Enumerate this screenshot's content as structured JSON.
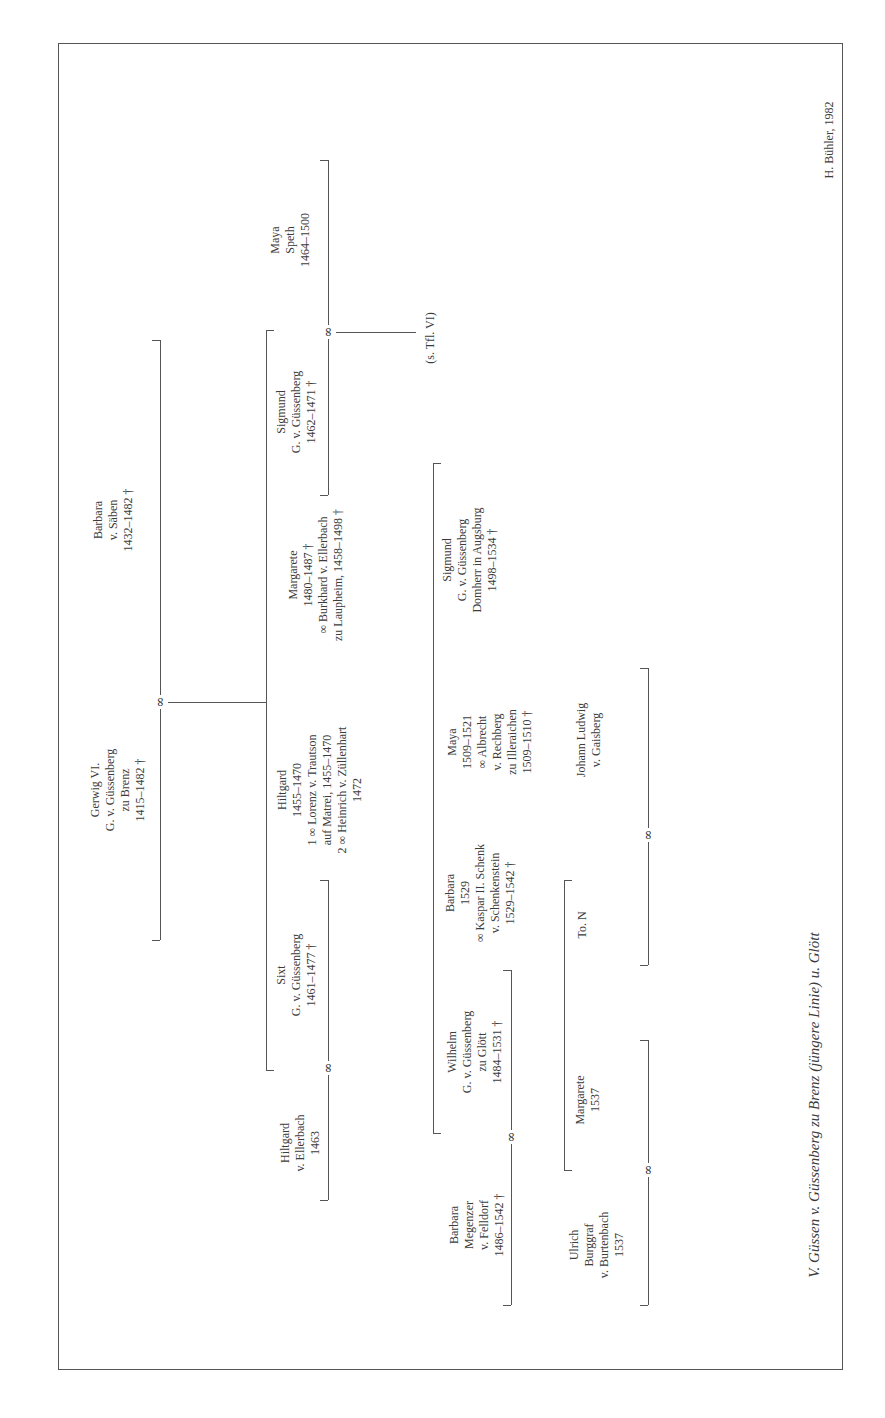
{
  "chart": {
    "title": "V. Güssen v. Güssenberg zu Brenz (jüngere Linie) u. Glött",
    "credit": "H. Bühler, 1982",
    "marriage_symbol": "∞",
    "cross_reference": "(s. Tfl. VI)"
  },
  "generation1": {
    "husband": {
      "lines": [
        "Gerwig VI.",
        "G. v. Güssenberg",
        "zu Brenz",
        "1415–1482 †"
      ]
    },
    "wife": {
      "lines": [
        "Barbara",
        "v. Säben",
        "1432–1482 †"
      ]
    }
  },
  "generation2": {
    "sigmund": {
      "lines": [
        "Sigmund",
        "G. v. Güssenberg",
        "1462–1471 †"
      ]
    },
    "sigmund_spouse": {
      "lines": [
        "Maya",
        "Speth",
        "1464–1500"
      ]
    },
    "margarete": {
      "lines": [
        "Margarete",
        "1480–1487 †",
        "∞ Burkhard v. Ellerbach",
        "zu Laupheim, 1458–1498 †"
      ]
    },
    "hiltgard": {
      "lines": [
        "Hiltgard",
        "1455–1470",
        "1 ∞  Lorenz v. Trautson",
        "auf Matrei, 1455–1470",
        "2 ∞ Heinrich v. Züllenhart",
        "1472"
      ]
    },
    "sixt": {
      "lines": [
        "Sixt",
        "G. v. Güssenberg",
        "1461–1477 †"
      ]
    },
    "sixt_spouse": {
      "lines": [
        "Hiltgard",
        "v. Ellerbach",
        "1463"
      ]
    }
  },
  "generation3": {
    "sigmund_domherr": {
      "lines": [
        "Sigmund",
        "G. v. Güssenberg",
        "Domherr in Augsburg",
        "1498–1534 †"
      ]
    },
    "maya": {
      "lines": [
        "Maya",
        "1509–1521",
        "∞ Albrecht",
        "v. Rechberg",
        "zu Illeraichen",
        "1509–1510 †"
      ]
    },
    "barbara": {
      "lines": [
        "Barbara",
        "1529",
        "∞ Kaspar II. Schenk",
        "v. Schenkenstein",
        "1529–1542 †"
      ]
    },
    "wilhelm": {
      "lines": [
        "Wilhelm",
        "G. v. Güssenberg",
        "zu Glött",
        "1484–1531 †"
      ]
    },
    "wilhelm_spouse": {
      "lines": [
        "Barbara",
        "Megenzer",
        "v. Felldorf",
        "1486–1542 †"
      ]
    }
  },
  "generation4": {
    "johann_ludwig": {
      "lines": [
        "Johann Ludwig",
        "v. Gaisberg"
      ]
    },
    "to_n": {
      "lines": [
        "To. N"
      ]
    },
    "margarete": {
      "lines": [
        "Margarete",
        "1537"
      ]
    },
    "ulrich": {
      "lines": [
        "Ulrich",
        "Burggraf",
        "v. Burtenbach",
        "1537"
      ]
    }
  }
}
